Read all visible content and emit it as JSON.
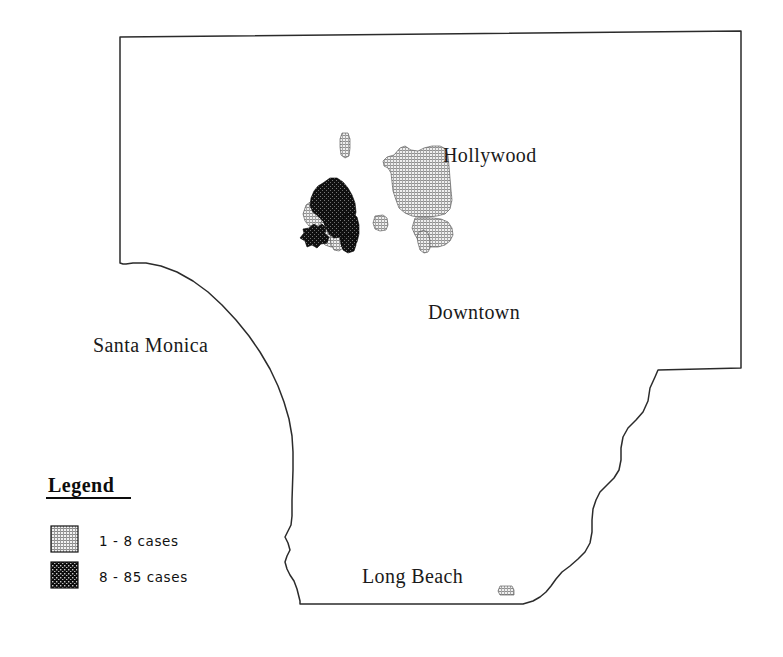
{
  "figure": {
    "type": "choropleth-map",
    "background_color": "#ffffff",
    "outline_color": "#2b2b2b",
    "width": 783,
    "height": 657
  },
  "map": {
    "name": "Los Angeles County area map",
    "place_labels": [
      {
        "name": "hollywood",
        "text": "Hollywood",
        "x": 443,
        "y": 162
      },
      {
        "name": "downtown",
        "text": "Downtown",
        "x": 428,
        "y": 319
      },
      {
        "name": "santa-monica",
        "text": "Santa Monica",
        "x": 93,
        "y": 352
      },
      {
        "name": "long-beach",
        "text": "Long Beach",
        "x": 362,
        "y": 583
      }
    ],
    "boundary_path": "M 120,37 L 741,31 L 741,368 L 658,370 L 655,377 L 650,388 L 648,401 L 643,412 L 636,420 L 628,428 L 623,437 L 621,448 L 621,460 L 619,470 L 614,478 L 607,485 L 600,492 L 596,500 L 593,509 L 592,520 L 592,532 L 590,543 L 585,552 L 578,559 L 570,566 L 562,572 L 556,579 L 551,586 L 546,592 L 540,597 L 533,601 L 523,604 L 300,604 L 300,601 L 297,589 L 294,581 L 290,575 L 287,569 L 285,562 L 287,556 L 290,550 L 288,543 L 285,537 L 288,531 L 291,525 L 292,516 L 292,500 L 293,470 L 293,452 L 292,436 L 289,419 L 284,402 L 278,386 L 270,369 L 260,352 L 249,336 L 236,320 L 222,305 L 208,292 L 193,281 L 177,272 L 161,266 L 146,263 L 133,263 L 126,264 L 123,264 L 120,263 Z"
  },
  "regions": {
    "low_class_shapes": [
      {
        "name": "region-hollywood-main",
        "path": "M 394,155 L 400,148 L 405,146 L 411,150 L 418,151 L 424,148 L 432,146 L 440,146 L 446,149 L 448,156 L 449,166 L 450,178 L 451,190 L 452,200 L 450,209 L 445,214 L 437,216 L 428,217 L 419,217 L 412,216 L 405,213 L 399,208 L 396,200 L 393,191 L 392,182 L 391,173 L 388,168 L 384,166 L 383,161 L 387,157 Z"
      },
      {
        "name": "region-hollywood-south",
        "path": "M 415,218 L 424,218 L 433,218 L 441,219 L 448,222 L 452,228 L 453,235 L 450,241 L 445,245 L 438,247 L 430,247 L 424,245 L 419,241 L 415,235 L 412,228 Z"
      },
      {
        "name": "region-hollywood-tail",
        "path": "M 419,232 L 424,230 L 428,233 L 430,240 L 430,248 L 428,252 L 424,253 L 420,250 L 418,243 L 417,237 Z"
      },
      {
        "name": "region-strip-north",
        "path": "M 342,133 L 348,133 L 350,139 L 350,148 L 349,156 L 345,158 L 341,155 L 340,147 L 340,139 Z"
      },
      {
        "name": "region-west-block",
        "path": "M 306,205 L 313,200 L 320,198 L 327,199 L 332,203 L 334,210 L 333,218 L 330,224 L 324,227 L 316,228 L 309,226 L 305,221 L 303,214 Z"
      },
      {
        "name": "region-center-block",
        "path": "M 323,219 L 331,218 L 338,219 L 343,222 L 345,229 L 345,237 L 343,243 L 338,246 L 331,247 L 325,245 L 321,240 L 319,232 L 320,224 Z"
      },
      {
        "name": "region-east-small",
        "path": "M 375,216 L 383,215 L 387,218 L 388,225 L 386,230 L 380,231 L 375,229 L 373,223 Z"
      },
      {
        "name": "region-south-sliver",
        "path": "M 332,228 L 339,227 L 343,231 L 344,240 L 343,248 L 339,251 L 334,250 L 331,244 L 330,236 Z"
      },
      {
        "name": "region-long-beach-spot",
        "path": "M 500,586 L 512,586 L 514,590 L 514,595 L 500,595 L 498,591 Z"
      }
    ],
    "high_class_shapes": [
      {
        "name": "region-high-main",
        "path": "M 323,183 L 330,178 L 337,178 L 343,182 L 348,188 L 352,195 L 355,203 L 356,212 L 354,220 L 350,227 L 345,233 L 340,237 L 334,238 L 329,234 L 326,228 L 323,221 L 318,216 L 313,212 L 310,206 L 311,198 L 314,191 L 318,186 Z"
      },
      {
        "name": "region-high-lobe",
        "path": "M 345,215 L 352,213 L 357,217 L 359,225 L 359,234 L 357,242 L 353,248 L 347,250 L 342,247 L 340,240 L 340,231 L 341,222 Z"
      },
      {
        "name": "region-high-star",
        "path": "M 309,228 L 314,224 L 318,227 L 322,224 L 326,228 L 325,234 L 329,237 L 327,243 L 321,244 L 317,248 L 312,245 L 307,247 L 305,241 L 300,238 L 304,233 L 303,229 Z"
      },
      {
        "name": "region-high-lower",
        "path": "M 344,236 L 350,234 L 355,238 L 356,245 L 354,251 L 348,253 L 343,250 L 341,244 Z"
      }
    ]
  },
  "legend": {
    "title": "Legend",
    "title_underlined": true,
    "entries": [
      {
        "name": "legend-entry-low",
        "label": "1 - 8 cases",
        "class": "low",
        "fill_style": "fine-grid-hatch",
        "color": "#b8b8b8"
      },
      {
        "name": "legend-entry-high",
        "label": "8 - 85 cases",
        "class": "high",
        "fill_style": "dark-dotted",
        "color": "#141414"
      }
    ]
  }
}
